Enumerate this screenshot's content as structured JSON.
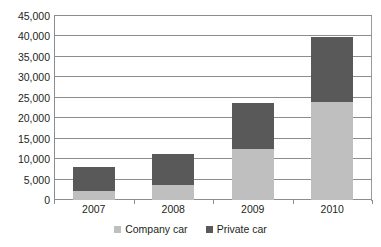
{
  "chart_data": {
    "type": "bar",
    "title": "",
    "subtitle": "",
    "xlabel": "",
    "ylabel": "",
    "stacked": true,
    "grid": true,
    "legend_position": "bottom",
    "categories": [
      "2007",
      "2008",
      "2009",
      "2010"
    ],
    "ylim": [
      0,
      45000
    ],
    "ytick_step": 5000,
    "ytick_labels": [
      "45,000",
      "40,000",
      "35,000",
      "30,000",
      "25,000",
      "20,000",
      "15,000",
      "10,000",
      "5,000",
      "0"
    ],
    "ytick_values": [
      45000,
      40000,
      35000,
      30000,
      25000,
      20000,
      15000,
      10000,
      5000,
      0
    ],
    "series": [
      {
        "name": "Company car",
        "color": "#bfbfbf",
        "values": [
          2200,
          3700,
          12500,
          24000
        ]
      },
      {
        "name": "Private car",
        "color": "#595959",
        "values": [
          5900,
          7600,
          11200,
          15800
        ]
      }
    ],
    "totals": [
      8100,
      11300,
      23700,
      39800
    ]
  },
  "legend": {
    "items": [
      {
        "label": "Company car",
        "color": "#bfbfbf",
        "swatch_icon": "square-swatch-icon"
      },
      {
        "label": "Private car",
        "color": "#595959",
        "swatch_icon": "square-swatch-icon"
      }
    ]
  },
  "axis": {
    "grid_color": "#8d8d8d",
    "text_color": "#231f20"
  }
}
